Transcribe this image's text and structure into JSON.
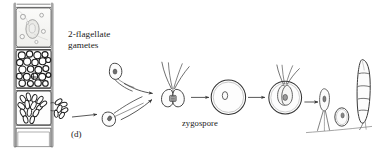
{
  "figure": {
    "panel_label": "(d)",
    "caption_subject": "sexual life cycle of a filamentous green alga",
    "background_color": "#ffffff",
    "ink_color": "#2b2b2b",
    "labels": {
      "gametes": "2-flagellate\ngametes",
      "zygospore": "zygospore"
    },
    "stages": [
      {
        "name": "vegetative-filament",
        "description": "four-celled filament; top cell vacuolate, second cell packed with round granules, third cell releasing gametes through a pore, bottom cell empty"
      },
      {
        "name": "free-gamete-upper",
        "description": "pear-shaped 2-flagellate gamete swimming"
      },
      {
        "name": "free-gamete-lower",
        "description": "pear-shaped 2-flagellate gamete swimming"
      },
      {
        "name": "fusing-gamete-pair",
        "description": "two gametes fused at the base with four flagella"
      },
      {
        "name": "zygospore",
        "description": "round thick-walled zygospore with central nucleus"
      },
      {
        "name": "germinating-zygospore",
        "description": "zygospore releasing a flagellated germling"
      },
      {
        "name": "sporeling-small",
        "description": "young attached sporeling with holdfast"
      },
      {
        "name": "sporeling-oval",
        "description": "oval germling on substrate"
      },
      {
        "name": "sporeling-filament",
        "description": "elongated multicellular filament with cross walls"
      }
    ],
    "arrows": [
      {
        "name": "filament-to-gamete",
        "from": "vegetative-filament",
        "to": "free-gamete-lower"
      },
      {
        "name": "upper-gamete-to-fusion",
        "from": "free-gamete-upper",
        "to": "fusing-gamete-pair"
      },
      {
        "name": "lower-gamete-to-fusion",
        "from": "free-gamete-lower",
        "to": "fusing-gamete-pair"
      },
      {
        "name": "fusion-to-zygospore",
        "from": "fusing-gamete-pair",
        "to": "zygospore"
      },
      {
        "name": "zygospore-to-germination",
        "from": "zygospore",
        "to": "germinating-zygospore"
      },
      {
        "name": "germination-to-sporeling",
        "from": "germinating-zygospore",
        "to": "sporeling-small"
      }
    ]
  }
}
